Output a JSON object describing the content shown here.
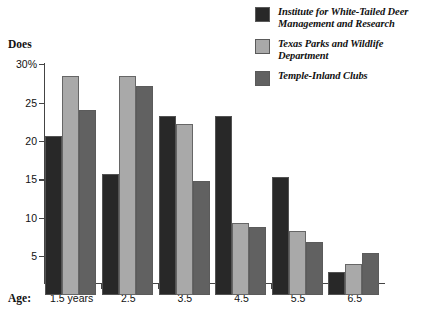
{
  "chart_data": {
    "type": "bar",
    "title": "",
    "ylabel": "Does",
    "xlabel": "Age:",
    "y_unit_label": "30%",
    "categories": [
      "1.5 years",
      "2.5",
      "3.5",
      "4.5",
      "5.5",
      "6.5"
    ],
    "yticks": [
      "30%",
      "25",
      "20",
      "15",
      "10",
      "5"
    ],
    "ytick_values": [
      30,
      25,
      20,
      15,
      10,
      5
    ],
    "ylim": [
      0,
      30
    ],
    "grid": false,
    "legend_position": "top-right",
    "series": [
      {
        "name": "Institute for White-Tailed Deer Management and Research",
        "name_line1": "Institute for White-Tailed Deer",
        "name_line2": "Management and Research",
        "color": "#282828",
        "values": [
          20.6,
          15.7,
          23.2,
          23.3,
          15.3,
          3.0
        ]
      },
      {
        "name": "Texas Parks and Wildlife Department",
        "name_line1": "Texas Parks and Wildlife",
        "name_line2": "Department",
        "color": "#a9a9a9",
        "values": [
          28.4,
          28.4,
          22.2,
          9.3,
          8.3,
          4.0
        ]
      },
      {
        "name": "Temple-Inland Clubs",
        "name_line1": "Temple-Inland Clubs",
        "name_line2": "",
        "color": "#616161",
        "values": [
          24.1,
          27.2,
          14.8,
          8.8,
          6.9,
          5.4
        ]
      }
    ]
  }
}
